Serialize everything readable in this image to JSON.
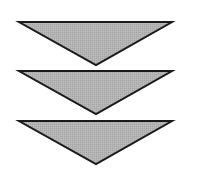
{
  "diagram": {
    "colors": {
      "fill": "#b3b3b3",
      "stroke": "#1a1a1a",
      "background": "#ffffff"
    },
    "stroke_width": 2,
    "triangles": [
      {
        "id": "triangle-1",
        "points": "19,22 172,22 96,65"
      },
      {
        "id": "triangle-2",
        "points": "19,71 172,71 96,114"
      },
      {
        "id": "triangle-3",
        "points": "19,121 172,121 96,164"
      }
    ]
  }
}
